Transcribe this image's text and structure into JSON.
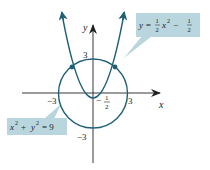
{
  "diagram": {
    "axes": {
      "x_label": "x",
      "y_label": "y",
      "x_ticks": {
        "neg": "−3",
        "pos": "3"
      },
      "y_ticks": {
        "pos": "3",
        "neg": "−3"
      }
    },
    "vertex_label": {
      "minus": "−",
      "num": "1",
      "den": "2"
    },
    "parabola_callout": {
      "lhs": "y =",
      "frac1": {
        "num": "1",
        "den": "2"
      },
      "mid": "x",
      "exp": "2",
      "minus": "−",
      "frac2": {
        "num": "1",
        "den": "2"
      }
    },
    "circle_callout": {
      "a": "x",
      "a_exp": "2",
      "plus": "+",
      "b": "y",
      "b_exp": "2",
      "rhs": "= 9"
    },
    "colors": {
      "curve": "#1f5f78",
      "callout_fill": "#b9d5de",
      "axis": "#222222"
    }
  }
}
